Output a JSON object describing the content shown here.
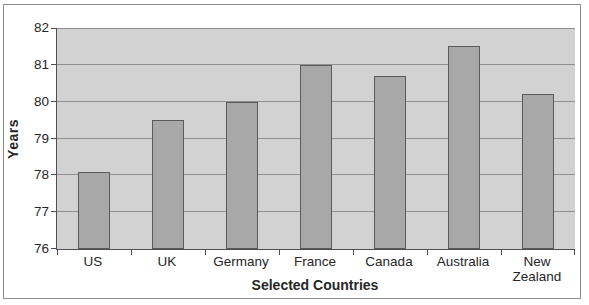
{
  "chart_data": {
    "type": "bar",
    "categories": [
      "US",
      "UK",
      "Germany",
      "France",
      "Canada",
      "Australia",
      "New Zealand"
    ],
    "values": [
      78.1,
      79.5,
      80.0,
      81.0,
      80.7,
      81.5,
      80.2
    ],
    "xlabel": "Selected Countries",
    "ylabel": "Years",
    "ylim": [
      76,
      82
    ],
    "yticks": [
      76,
      77,
      78,
      79,
      80,
      81,
      82
    ],
    "grid": true,
    "legend": false,
    "colors": {
      "page_bg": "#ffffff",
      "frame_border": "#8c8c8c",
      "plot_bg": "#d2d2d2",
      "bar_fill": "#a8a8a8",
      "bar_border": "#5a5a5a",
      "gridline": "#909090",
      "axis": "#4f4f4f",
      "text": "#262626"
    }
  }
}
